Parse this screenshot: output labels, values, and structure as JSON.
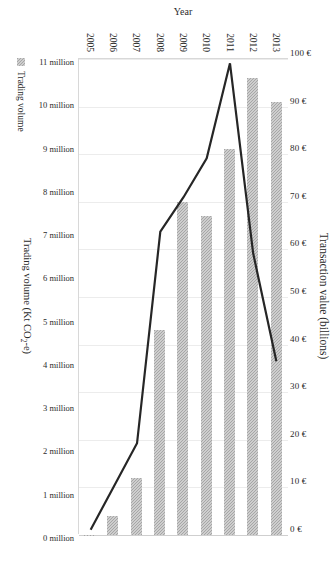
{
  "chart_data": {
    "type": "bar",
    "title": "",
    "orientation": "horizontal-rotated",
    "categories": [
      "2013",
      "2012",
      "2011",
      "2010",
      "2009",
      "2008",
      "2007",
      "2006",
      "2005"
    ],
    "series": [
      {
        "name": "Transaction value",
        "type": "bar",
        "unit": "billions EUR",
        "values": [
          91,
          96,
          81,
          67,
          70,
          43,
          12,
          4,
          0
        ]
      },
      {
        "name": "Trading volume",
        "type": "line",
        "unit": "Kt CO2-e",
        "values": [
          4000000,
          6500000,
          10900000,
          8700000,
          7800000,
          7000000,
          2100000,
          1100000,
          100000
        ]
      }
    ],
    "bar_axis": {
      "label": "Transaction value (billions)",
      "ticks": [
        "100 €",
        "90 €",
        "80 €",
        "70 €",
        "60 €",
        "50 €",
        "40 €",
        "30 €",
        "20 €",
        "10 €",
        "0 €"
      ],
      "min": 0,
      "max": 100,
      "reversed": true,
      "position": "top"
    },
    "line_axis": {
      "label": "Trading volume (Kt CO",
      "label_sub": "2",
      "label_tail": "-e)",
      "label_full": "Trading volume (Kt CO2-e)",
      "ticks": [
        "11 million",
        "10 million",
        "9 million",
        "8 million",
        "7 million",
        "6 million",
        "5 million",
        "4 million",
        "3 million",
        "2 million",
        "1 million",
        "0 million"
      ],
      "min": 0,
      "max": 11000000,
      "reversed": true,
      "position": "bottom"
    },
    "category_axis": {
      "label": "Year",
      "position": "right"
    },
    "legend": {
      "position": "bottom-left",
      "entries": [
        {
          "label": "Trading volume",
          "color": "#a6a6a6",
          "marker": "square-hatched"
        }
      ]
    },
    "grid": true,
    "colors": {
      "bar": "#a6a6a6",
      "line": "#262626",
      "grid": "#ececec",
      "axis": "#d8d8d8",
      "text": "#2b2b2b"
    }
  }
}
